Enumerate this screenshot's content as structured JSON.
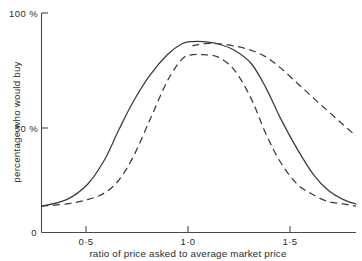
{
  "chart_data": {
    "type": "line",
    "title": "",
    "subtitle": "",
    "xlabel": "ratio of price asked to average market price",
    "ylabel": "percentage who would buy",
    "xlim": [
      0.28,
      1.78
    ],
    "ylim": [
      0,
      100
    ],
    "grid": false,
    "legend": null,
    "legend_position": "none",
    "x_ticks": [
      {
        "value": 0.5,
        "label": "0·5"
      },
      {
        "value": 1.0,
        "label": "1·0"
      },
      {
        "value": 1.5,
        "label": "1·5"
      }
    ],
    "y_ticks": [
      {
        "value": 0,
        "label": "0"
      },
      {
        "value": 50,
        "label": "50 %"
      },
      {
        "value": 100,
        "label": "100 %"
      }
    ],
    "x": [
      0.28,
      0.4,
      0.5,
      0.58,
      0.65,
      0.72,
      0.8,
      0.88,
      0.95,
      1.0,
      1.05,
      1.12,
      1.2,
      1.28,
      1.35,
      1.42,
      1.5,
      1.58,
      1.65,
      1.72,
      1.78
    ],
    "series": [
      {
        "name": "solid-curve",
        "style": "solid",
        "values": [
          12,
          15,
          22,
          33,
          47,
          60,
          72,
          81,
          86,
          87,
          87,
          86,
          83,
          77,
          66,
          52,
          38,
          26,
          19,
          15,
          13
        ]
      },
      {
        "name": "dashed-curve-narrow",
        "style": "dashed",
        "values": [
          12,
          13,
          15,
          18,
          24,
          35,
          52,
          69,
          79,
          81,
          81,
          80,
          74,
          61,
          45,
          32,
          22,
          17,
          14,
          13,
          12
        ]
      },
      {
        "name": "dashed-curve-broad",
        "style": "dashed",
        "values": [
          null,
          null,
          null,
          null,
          null,
          null,
          null,
          null,
          null,
          85,
          86,
          86,
          85,
          83,
          80,
          75,
          68,
          61,
          55,
          49,
          44
        ]
      }
    ],
    "annotations": []
  },
  "axis": {
    "percent_symbol": "%",
    "y_label_text": "percentage who would buy",
    "x_label_text": "ratio of price asked to average market price",
    "origin_label": "0",
    "top_label": "100 %",
    "mid_label": "50 %",
    "x_tick_1": "0·5",
    "x_tick_2": "1·0",
    "x_tick_3": "1·5"
  },
  "colors": {
    "background": "#ffffff",
    "ink": "#3a3a3a",
    "axis": "#4a4a4a"
  }
}
